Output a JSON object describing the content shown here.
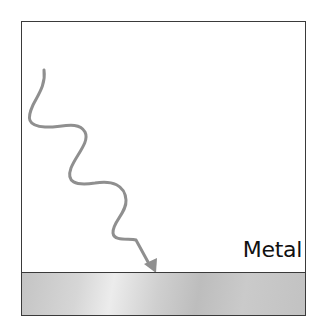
{
  "diagram": {
    "material_label": "Metal",
    "colors": {
      "frame_border": "#3a3a3a",
      "wave": "#8f8f8f",
      "metal_fill": "#c8c8c8",
      "label": "#111111"
    },
    "elements": [
      {
        "type": "incident-wave",
        "description": "wavy gray arrow descending toward metal surface"
      },
      {
        "type": "metal-slab",
        "description": "gray gradient band at bottom"
      }
    ]
  }
}
